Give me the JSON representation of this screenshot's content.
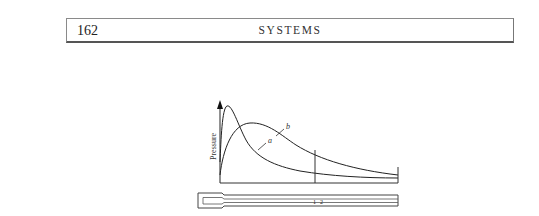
{
  "header": {
    "page_number": "162",
    "running_title": "SYSTEMS"
  },
  "figure": {
    "y_axis_label": "Pressure",
    "curve_labels": {
      "a": "a",
      "b": "b"
    },
    "tube_labels": {
      "one": "1",
      "two": "2"
    }
  }
}
